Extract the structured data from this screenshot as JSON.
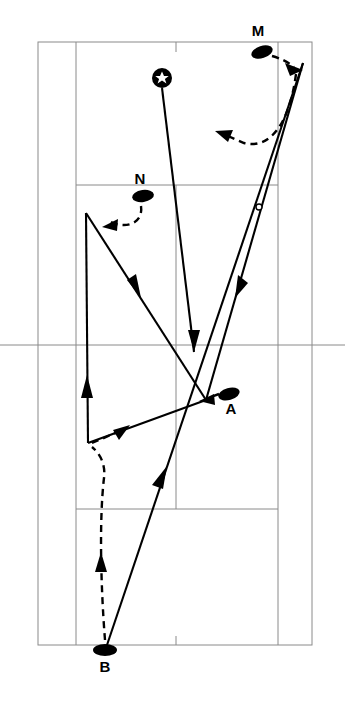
{
  "figure": {
    "kind": "tennis-court-tactics-diagram",
    "background_color": "#ffffff",
    "line_color": "#8a8a8a",
    "ink_color": "#000000",
    "width": 345,
    "height": 706
  },
  "court": {
    "doubles_sideline_left_x": 38,
    "singles_sideline_left_x": 76,
    "singles_sideline_right_x": 278,
    "doubles_sideline_right_x": 312,
    "far_baseline_y": 42,
    "near_baseline_y": 645,
    "far_service_line_y": 185,
    "near_service_line_y": 509,
    "net_y": 345,
    "center_service_line_x": 176,
    "net_extends_beyond_court": true,
    "center_mark_far_y_top": 42,
    "center_mark_near_y_bottom": 645
  },
  "markers": [
    {
      "name": "player-m",
      "label": "M",
      "label_position": "above",
      "x": 262,
      "y": 52,
      "rx": 11,
      "ry": 6,
      "rotation": -18,
      "label_x": 258,
      "label_y": 36
    },
    {
      "name": "player-n",
      "label": "N",
      "label_position": "above",
      "x": 143,
      "y": 196,
      "rx": 11,
      "ry": 6,
      "rotation": -8,
      "label_x": 140,
      "label_y": 184
    },
    {
      "name": "player-a",
      "label": "A",
      "label_position": "below",
      "x": 229,
      "y": 394,
      "rx": 11,
      "ry": 6,
      "rotation": -16,
      "label_x": 231,
      "label_y": 414
    },
    {
      "name": "player-b",
      "label": "B",
      "label_position": "below",
      "x": 105,
      "y": 650,
      "rx": 12,
      "ry": 6,
      "rotation": 0,
      "label_x": 105,
      "label_y": 672
    }
  ],
  "server": {
    "name": "server-position",
    "symbol": "star-in-circle",
    "x": 162,
    "y": 78,
    "ring_radius": 10,
    "star_radius": 7
  },
  "bounce_marker": {
    "name": "ball-bounce-point",
    "x": 259,
    "y": 207,
    "radius": 3
  },
  "ball_paths": [
    {
      "name": "serve-from-star-to-midcourt",
      "points": [
        [
          162,
          88
        ],
        [
          194,
          352
        ]
      ],
      "arrow_at": [
        194,
        352
      ],
      "arrow_angle": 83
    },
    {
      "name": "shot-b-to-far-corner",
      "points": [
        [
          106,
          648
        ],
        [
          303,
          63
        ]
      ],
      "arrow_at": [
        160,
        487
      ],
      "arrow_angle": -71
    },
    {
      "name": "shot-corner-to-midcourt-a",
      "points": [
        [
          303,
          63
        ],
        [
          206,
          400
        ]
      ],
      "arrow_at": [
        240,
        282
      ],
      "arrow_angle": 106
    },
    {
      "name": "shot-midcourt-to-near-left",
      "points": [
        [
          206,
          400
        ],
        [
          88,
          443
        ]
      ],
      "arrow_at": null,
      "arrow_angle": 0
    },
    {
      "name": "shot-near-left-upward",
      "points": [
        [
          88,
          443
        ],
        [
          86,
          213
        ]
      ],
      "arrow_at": [
        87,
        388
      ],
      "arrow_angle": -90
    },
    {
      "name": "shot-upper-left-to-midcourt",
      "points": [
        [
          86,
          213
        ],
        [
          206,
          400
        ]
      ],
      "arrow_at": [
        132,
        285
      ],
      "arrow_angle": 57
    }
  ],
  "player_paths": [
    {
      "name": "m-movement-to-corner",
      "points": [
        [
          272,
          56
        ],
        [
          285,
          62
        ],
        [
          296,
          68
        ]
      ],
      "arrow_at": [
        299,
        66
      ],
      "arrow_angle": 22,
      "style": "dashed"
    },
    {
      "name": "recovery-curve-toward-centre",
      "points": [
        [
          294,
          72
        ],
        [
          283,
          118
        ],
        [
          262,
          144
        ],
        [
          238,
          140
        ],
        [
          224,
          134
        ]
      ],
      "arrow_at": [
        218,
        132
      ],
      "arrow_angle": 200,
      "style": "dashed"
    },
    {
      "name": "n-movement-to-left",
      "points": [
        [
          140,
          205
        ],
        [
          141,
          219
        ],
        [
          128,
          226
        ],
        [
          112,
          222
        ]
      ],
      "arrow_at": [
        107,
        224
      ],
      "arrow_angle": 150,
      "style": "dashed"
    },
    {
      "name": "near-left-advance",
      "points": [
        [
          92,
          442
        ],
        [
          108,
          436
        ],
        [
          120,
          430
        ]
      ],
      "arrow_at": [
        126,
        427
      ],
      "arrow_angle": -27,
      "style": "dashed"
    },
    {
      "name": "b-movement-up-court",
      "points": [
        [
          105,
          640
        ],
        [
          101,
          560
        ],
        [
          100,
          500
        ],
        [
          104,
          470
        ],
        [
          92,
          449
        ]
      ],
      "arrow_at": [
        100,
        560
      ],
      "arrow_angle": -88,
      "style": "dashed"
    },
    {
      "name": "a-movement-to-net",
      "points": [
        [
          220,
          394
        ],
        [
          208,
          398
        ]
      ],
      "arrow_at": [
        202,
        400
      ],
      "arrow_angle": 180,
      "style": "dashed"
    }
  ]
}
